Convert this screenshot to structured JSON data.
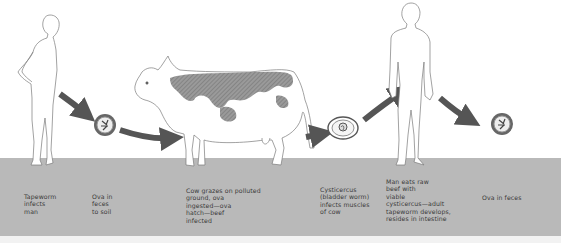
{
  "diagram": {
    "colors": {
      "background": "#ffffff",
      "ground": "#b9b9b9",
      "arrow": "#555555",
      "outline": "#777777",
      "cow_spots": "#8a8a8a"
    },
    "stages": [
      {
        "id": "man-infected",
        "icon": "human-figure-icon",
        "caption": "Tapeworm\ninfects\nman"
      },
      {
        "id": "ova-soil",
        "icon": "ovum-icon",
        "caption": "Ova in\nfeces\nto soil"
      },
      {
        "id": "cow",
        "icon": "cow-icon",
        "caption": "Cow grazes on polluted\nground, ova\ningested—ova\nhatch—beef\ninfected"
      },
      {
        "id": "cysticercus",
        "icon": "cysticercus-icon",
        "caption": "Cysticercus\n(bladder worm)\ninfects muscles\nof cow"
      },
      {
        "id": "man-eats",
        "icon": "human-figure-icon",
        "caption": "Man eats raw\nbeef with\nviable\ncysticercus—adult\ntapeworm develops,\nresides in intestine"
      },
      {
        "id": "ova-feces",
        "icon": "ovum-icon",
        "caption": "Ova in feces"
      }
    ]
  }
}
